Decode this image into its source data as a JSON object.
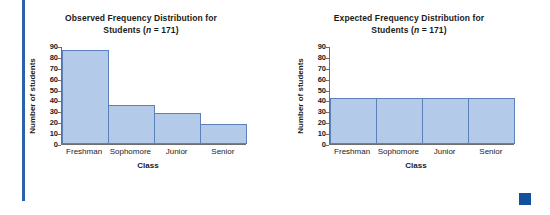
{
  "page": {
    "accent_rule_color": "#2a61a8",
    "corner_marker_color": "#14509b"
  },
  "charts": [
    {
      "id": "observed",
      "title_line1": "Observed Frequency Distribution for",
      "title_line2_prefix": "Students (",
      "title_line2_italic": "n",
      "title_line2_suffix": " = 171)",
      "ylabel": "Number of students",
      "xlabel": "Class"
    },
    {
      "id": "expected",
      "title_line1": "Expected Frequency Distribution for",
      "title_line2_prefix": "Students (",
      "title_line2_italic": "n",
      "title_line2_suffix": " = 171)",
      "ylabel": "Number of students",
      "xlabel": "Class"
    }
  ],
  "chart_data": [
    {
      "type": "bar",
      "title": "Observed Frequency Distribution for Students (n = 171)",
      "xlabel": "Class",
      "ylabel": "Number of students",
      "categories": [
        "Freshman",
        "Sophomore",
        "Junior",
        "Senior"
      ],
      "values": [
        87,
        36,
        29,
        19
      ],
      "ylim": [
        0,
        90
      ],
      "yticks": [
        0,
        10,
        20,
        30,
        40,
        50,
        60,
        70,
        80,
        90
      ],
      "ytick_labels": [
        "0",
        "10",
        "20",
        "30",
        "40",
        "50",
        "60",
        "70",
        "80",
        "90"
      ],
      "grid": false,
      "legend": "none",
      "bar_fill": "#b3cbe8",
      "bar_edge": "#5b81b8",
      "n": 171
    },
    {
      "type": "bar",
      "title": "Expected Frequency Distribution for Students (n = 171)",
      "xlabel": "Class",
      "ylabel": "Number of students",
      "categories": [
        "Freshman",
        "Sophomore",
        "Junior",
        "Senior"
      ],
      "values": [
        42.75,
        42.75,
        42.75,
        42.75
      ],
      "ylim": [
        0,
        90
      ],
      "yticks": [
        0,
        10,
        20,
        30,
        40,
        50,
        60,
        70,
        80,
        90
      ],
      "ytick_labels": [
        "0",
        "10",
        "20",
        "30",
        "40",
        "50",
        "60",
        "70",
        "80",
        "90"
      ],
      "grid": false,
      "legend": "none",
      "bar_fill": "#b3cbe8",
      "bar_edge": "#5b81b8",
      "n": 171
    }
  ]
}
